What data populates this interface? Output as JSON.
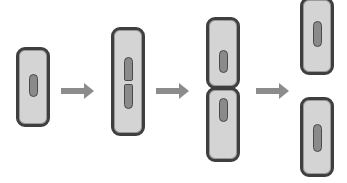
{
  "diagram": {
    "stages": [
      {
        "name": "single-cell",
        "description": "cell with single DNA"
      },
      {
        "name": "elongated-cell",
        "description": "elongated cell with replicating DNA"
      },
      {
        "name": "dividing-cell",
        "description": "cell pinching into two"
      },
      {
        "name": "daughter-cells",
        "description": "two separated daughter cells"
      }
    ],
    "arrows": 3,
    "colors": {
      "cell_fill": "#d4d4d4",
      "cell_border": "#3f3f3f",
      "dna": "#8a8a8a",
      "arrow": "#8c8c8c"
    }
  }
}
